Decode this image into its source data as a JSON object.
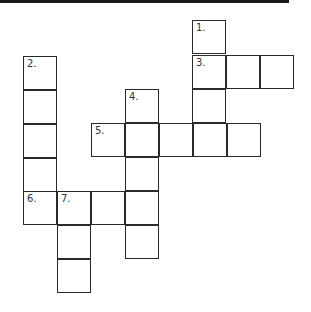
{
  "colors": {
    "line": "#2a2a2a",
    "background": "#ffffff",
    "topbar": "#1a1a1a"
  },
  "cells": [
    {
      "x": 192,
      "y": 20,
      "number": "1."
    },
    {
      "x": 192,
      "y": 55,
      "number": "3."
    },
    {
      "x": 226,
      "y": 55,
      "number": ""
    },
    {
      "x": 260,
      "y": 55,
      "number": ""
    },
    {
      "x": 192,
      "y": 89,
      "number": ""
    },
    {
      "x": 23,
      "y": 56,
      "number": "2."
    },
    {
      "x": 23,
      "y": 90,
      "number": ""
    },
    {
      "x": 23,
      "y": 124,
      "number": ""
    },
    {
      "x": 23,
      "y": 158,
      "number": ""
    },
    {
      "x": 125,
      "y": 89,
      "number": "4."
    },
    {
      "x": 91,
      "y": 123,
      "number": "5."
    },
    {
      "x": 125,
      "y": 123,
      "number": ""
    },
    {
      "x": 159,
      "y": 123,
      "number": ""
    },
    {
      "x": 193,
      "y": 123,
      "number": ""
    },
    {
      "x": 227,
      "y": 123,
      "number": ""
    },
    {
      "x": 125,
      "y": 157,
      "number": ""
    },
    {
      "x": 23,
      "y": 191,
      "number": "6."
    },
    {
      "x": 57,
      "y": 191,
      "number": "7."
    },
    {
      "x": 91,
      "y": 191,
      "number": ""
    },
    {
      "x": 125,
      "y": 191,
      "number": ""
    },
    {
      "x": 57,
      "y": 225,
      "number": ""
    },
    {
      "x": 125,
      "y": 225,
      "number": ""
    },
    {
      "x": 57,
      "y": 259,
      "number": ""
    }
  ]
}
